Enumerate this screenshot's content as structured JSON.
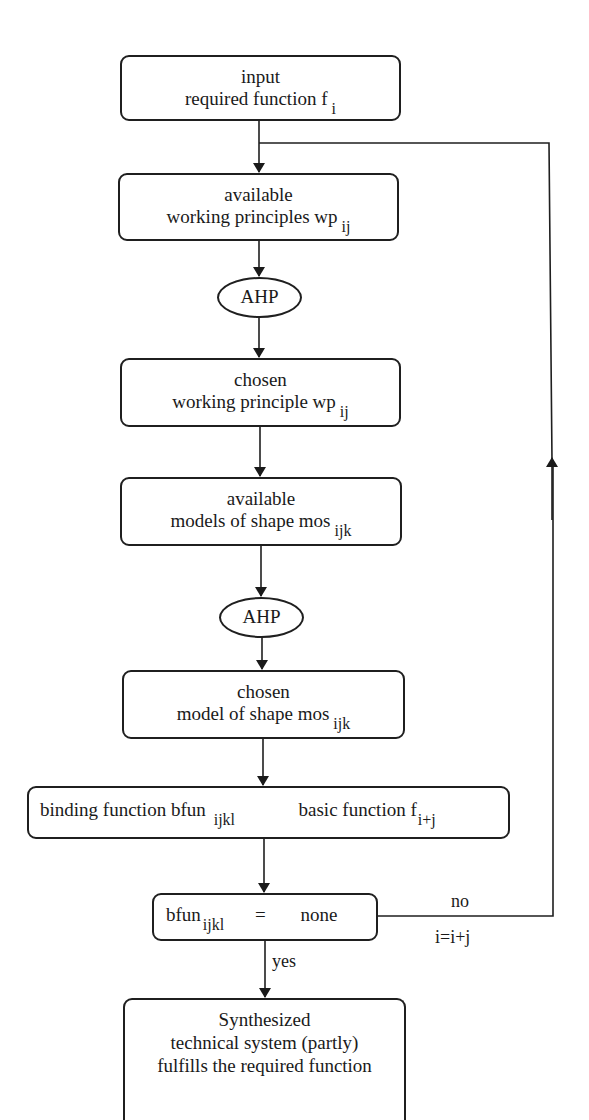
{
  "diagram": {
    "nodes": {
      "input": {
        "line1": "input",
        "line2_main": "required function f",
        "line2_sub": "i"
      },
      "available_wp": {
        "line1": "available",
        "line2_main": "working principles wp",
        "line2_sub": "ij"
      },
      "ahp1": {
        "label": "AHP"
      },
      "chosen_wp": {
        "line1": "chosen",
        "line2_main": "working principle wp",
        "line2_sub": "ij"
      },
      "available_mos": {
        "line1": "available",
        "line2_main": "models of shape mos",
        "line2_sub": "ijk"
      },
      "ahp2": {
        "label": "AHP"
      },
      "chosen_mos": {
        "line1": "chosen",
        "line2_main": "model of shape mos",
        "line2_sub": "ijk"
      },
      "binding": {
        "left_main": "binding function bfun",
        "left_sub": "ijkl",
        "arrow": "→",
        "right_main": "basic function f",
        "right_sub": "i+j"
      },
      "decision": {
        "left_main": "bfun",
        "left_sub": "ijkl",
        "op": "=",
        "right": "none"
      },
      "result": {
        "line1": "Synthesized",
        "line2": "technical system (partly)",
        "line3": "fulfills the required function"
      }
    },
    "edge_labels": {
      "no": "no",
      "increment": "i=i+j",
      "yes": "yes"
    }
  }
}
